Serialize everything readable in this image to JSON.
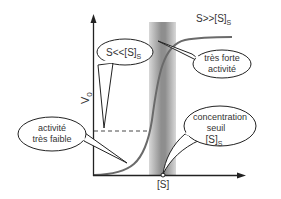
{
  "diagram": {
    "y_axis_label": "V",
    "y_axis_label_sub": "0",
    "x_axis_tick_label": "[S]",
    "callouts": {
      "low_substrate": {
        "main": "S<<[S]",
        "sub": "S"
      },
      "high_substrate": {
        "main": "S>>[S]",
        "sub": "S"
      },
      "very_strong": {
        "line1": "très forte",
        "line2": "activité"
      },
      "very_weak": {
        "line1": "activité",
        "line2": "très faible"
      },
      "threshold": {
        "line1": "concentration",
        "line2": "seuil",
        "line3_main": "[S]",
        "line3_sub": "S"
      }
    },
    "colors": {
      "axis": "#222222",
      "curve": "#6a6a6a",
      "band_center": "#8c8c8c",
      "band_edge": "#d6d6d6"
    }
  }
}
